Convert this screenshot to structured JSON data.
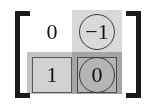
{
  "figure": {
    "name": "matrix-with-row-and-column-highlights",
    "bracket_left": "[",
    "bracket_right": "]",
    "bracket_color": "#1a1a1a",
    "background_color": "#ffffff"
  },
  "highlights": {
    "column": {
      "index": 2,
      "label": "column-2-highlight",
      "color": "#d9d9d9"
    },
    "row": {
      "index": 2,
      "label": "row-2-highlight",
      "color": "#c2c2c2"
    }
  },
  "matrix": {
    "rows": 2,
    "cols": 2,
    "cells": [
      {
        "id": "cell-r1c1",
        "value": "0",
        "circled": false,
        "boxed": false,
        "shaded": false
      },
      {
        "id": "cell-r1c2",
        "value": "−1",
        "circled": true,
        "boxed": false,
        "shaded": true
      },
      {
        "id": "cell-r2c1",
        "value": "1",
        "circled": false,
        "boxed": true,
        "shaded": false
      },
      {
        "id": "cell-r2c2",
        "value": "0",
        "circled": true,
        "boxed": true,
        "shaded": true
      }
    ]
  },
  "annotation_colors": {
    "circle_stroke": "#3a3a3a",
    "box_stroke": "#595959",
    "box_fill": "#d2d2d2",
    "box_fill_dark": "#b4b4b4",
    "text": "#111111"
  }
}
